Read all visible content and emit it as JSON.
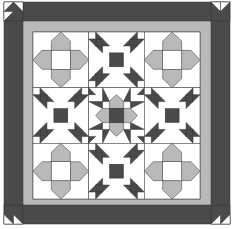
{
  "caption": "Quilt pattern: bear paw and cross blocks with dark border",
  "colors": {
    "background": "#ffffff",
    "dark": "#4a4a4a",
    "gray": "#b9b9b9",
    "white": "#ffffff",
    "line": "#333333"
  },
  "quilt": {
    "outer": {
      "x": 4,
      "y": 2,
      "w": 226,
      "h": 222
    },
    "border_width": 19,
    "sashing_width": 9,
    "inner": {
      "x": 33,
      "y": 32,
      "w": 167,
      "h": 167
    },
    "grid": {
      "rows": 3,
      "cols": 3
    },
    "blocks": [
      [
        "cross",
        "paw",
        "cross"
      ],
      [
        "paw",
        "star",
        "paw"
      ],
      [
        "cross",
        "paw",
        "cross"
      ]
    ],
    "corner_blocks": [
      "top-left",
      "top-right",
      "bottom-left",
      "bottom-right"
    ]
  }
}
